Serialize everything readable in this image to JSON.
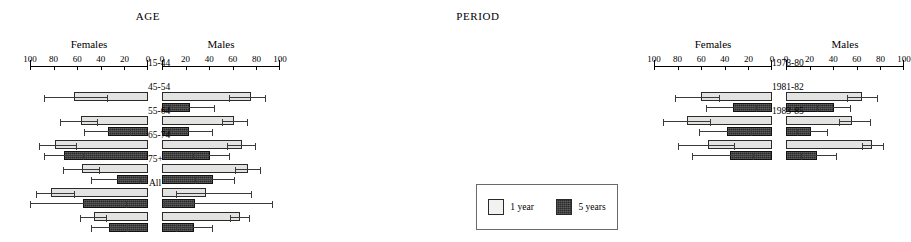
{
  "legend": {
    "items": [
      {
        "label": "1 year",
        "color": "#f2f2f0",
        "key": "one_year"
      },
      {
        "label": "5 years",
        "color": "#2b2b2b",
        "key": "five_years"
      }
    ]
  },
  "chart_data": [
    {
      "type": "bar",
      "title": "AGE",
      "orientation": "horizontal",
      "layout": "back-to-back-pyramid",
      "xlabel": "",
      "ylabel": "",
      "xlim": [
        0,
        100
      ],
      "grid": false,
      "legend_position": "outside-bottom-right",
      "sides": [
        {
          "key": "females",
          "label": "Females",
          "direction": "right-to-left",
          "ticks": [
            100,
            80,
            60,
            40,
            20,
            0
          ]
        },
        {
          "key": "males",
          "label": "Males",
          "direction": "left-to-right",
          "ticks": [
            0,
            20,
            40,
            60,
            80,
            100
          ]
        }
      ],
      "categories": [
        "15-44",
        "45-54",
        "55-64",
        "65-74",
        "75+",
        "All"
      ],
      "series": [
        {
          "name": "1 year",
          "side": "females",
          "values": [
            63,
            57,
            79,
            56,
            82,
            46
          ],
          "ci_low": [
            88,
            75,
            92,
            72,
            95,
            58
          ],
          "ci_high": [
            34,
            42,
            60,
            41,
            62,
            35
          ]
        },
        {
          "name": "5 years",
          "side": "females",
          "values": [
            null,
            34,
            71,
            26,
            55,
            33
          ],
          "ci_low": [
            null,
            54,
            88,
            48,
            100,
            48
          ],
          "ci_high": [
            null,
            14,
            54,
            6,
            18,
            17
          ]
        },
        {
          "name": "1 year",
          "side": "males",
          "values": [
            75,
            61,
            68,
            73,
            37,
            66
          ],
          "ci_low": [
            57,
            51,
            55,
            62,
            12,
            58
          ],
          "ci_high": [
            88,
            73,
            80,
            84,
            76,
            75
          ]
        },
        {
          "name": "5 years",
          "side": "males",
          "values": [
            24,
            23,
            41,
            43,
            28,
            27
          ],
          "ci_low": [
            6,
            6,
            26,
            28,
            2,
            12
          ],
          "ci_high": [
            45,
            43,
            58,
            62,
            94,
            43
          ]
        }
      ]
    },
    {
      "type": "bar",
      "title": "PERIOD",
      "orientation": "horizontal",
      "layout": "back-to-back-pyramid",
      "xlabel": "",
      "ylabel": "",
      "xlim": [
        0,
        100
      ],
      "grid": false,
      "legend_position": "outside-bottom-right",
      "sides": [
        {
          "key": "females",
          "label": "Females",
          "direction": "right-to-left",
          "ticks": [
            100,
            80,
            60,
            40,
            20,
            0
          ]
        },
        {
          "key": "males",
          "label": "Males",
          "direction": "left-to-right",
          "ticks": [
            0,
            20,
            40,
            60,
            80,
            100
          ]
        }
      ],
      "categories": [
        "1978-80",
        "1981-82",
        "1983-85"
      ],
      "series": [
        {
          "name": "1 year",
          "side": "females",
          "values": [
            60,
            72,
            54
          ],
          "ci_low": [
            82,
            92,
            80
          ],
          "ci_high": [
            44,
            52,
            31
          ]
        },
        {
          "name": "5 years",
          "side": "females",
          "values": [
            33,
            38,
            36
          ],
          "ci_low": [
            56,
            62,
            68
          ],
          "ci_high": [
            13,
            17,
            15
          ]
        },
        {
          "name": "1 year",
          "side": "males",
          "values": [
            64,
            56,
            73
          ],
          "ci_low": [
            52,
            45,
            64
          ],
          "ci_high": [
            78,
            72,
            83
          ]
        },
        {
          "name": "5 years",
          "side": "males",
          "values": [
            41,
            21,
            26
          ],
          "ci_low": [
            26,
            9,
            13
          ],
          "ci_high": [
            55,
            36,
            43
          ]
        }
      ]
    }
  ]
}
